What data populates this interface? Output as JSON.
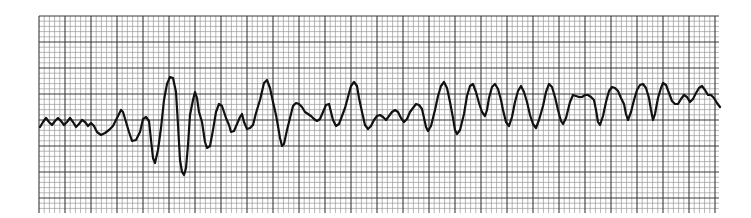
{
  "figure": {
    "kind": "ECG rhythm strip",
    "colors": {
      "background": "#ffffff",
      "paper_minor_grid": "#9a9a9a",
      "paper_major_grid": "#3a3a3a",
      "trace": "#111111"
    },
    "grid": {
      "left": 39,
      "top": 16,
      "right": 719,
      "bottom": 213,
      "minor_px": 5.2,
      "major_every": 5
    },
    "trace": {
      "stroke_width": 2.2,
      "points": [
        [
          40,
          127
        ],
        [
          43,
          122
        ],
        [
          46,
          118
        ],
        [
          49,
          122
        ],
        [
          52,
          125
        ],
        [
          55,
          121
        ],
        [
          58,
          118
        ],
        [
          61,
          121
        ],
        [
          64,
          125
        ],
        [
          67,
          122
        ],
        [
          70,
          118
        ],
        [
          73,
          122
        ],
        [
          76,
          127
        ],
        [
          79,
          124
        ],
        [
          82,
          120
        ],
        [
          85,
          122
        ],
        [
          88,
          126
        ],
        [
          91,
          123
        ],
        [
          94,
          126
        ],
        [
          97,
          132
        ],
        [
          101,
          135
        ],
        [
          105,
          133
        ],
        [
          109,
          130
        ],
        [
          113,
          126
        ],
        [
          117,
          118
        ],
        [
          121,
          110
        ],
        [
          123,
          112
        ],
        [
          126,
          122
        ],
        [
          129,
          132
        ],
        [
          132,
          141
        ],
        [
          136,
          140
        ],
        [
          140,
          132
        ],
        [
          143,
          119
        ],
        [
          146,
          117
        ],
        [
          149,
          121
        ],
        [
          151,
          140
        ],
        [
          153,
          158
        ],
        [
          155,
          163
        ],
        [
          158,
          150
        ],
        [
          161,
          128
        ],
        [
          164,
          100
        ],
        [
          167,
          84
        ],
        [
          170,
          77
        ],
        [
          173,
          78
        ],
        [
          176,
          92
        ],
        [
          178,
          125
        ],
        [
          180,
          160
        ],
        [
          182,
          172
        ],
        [
          184,
          175
        ],
        [
          186,
          168
        ],
        [
          188,
          145
        ],
        [
          190,
          115
        ],
        [
          193,
          100
        ],
        [
          195,
          92
        ],
        [
          197,
          98
        ],
        [
          199,
          112
        ],
        [
          202,
          122
        ],
        [
          205,
          142
        ],
        [
          207,
          148
        ],
        [
          210,
          146
        ],
        [
          213,
          130
        ],
        [
          216,
          112
        ],
        [
          219,
          104
        ],
        [
          222,
          106
        ],
        [
          224,
          112
        ],
        [
          226,
          118
        ],
        [
          229,
          125
        ],
        [
          231,
          132
        ],
        [
          234,
          131
        ],
        [
          237,
          124
        ],
        [
          240,
          117
        ],
        [
          242,
          114
        ],
        [
          244,
          122
        ],
        [
          247,
          129
        ],
        [
          250,
          128
        ],
        [
          253,
          125
        ],
        [
          256,
          113
        ],
        [
          260,
          100
        ],
        [
          264,
          83
        ],
        [
          267,
          80
        ],
        [
          270,
          88
        ],
        [
          273,
          102
        ],
        [
          276,
          115
        ],
        [
          278,
          126
        ],
        [
          280,
          138
        ],
        [
          282,
          146
        ],
        [
          284,
          144
        ],
        [
          287,
          130
        ],
        [
          290,
          118
        ],
        [
          293,
          106
        ],
        [
          296,
          103
        ],
        [
          299,
          104
        ],
        [
          302,
          107
        ],
        [
          305,
          112
        ],
        [
          308,
          114
        ],
        [
          311,
          116
        ],
        [
          314,
          119
        ],
        [
          317,
          121
        ],
        [
          320,
          119
        ],
        [
          323,
          112
        ],
        [
          326,
          105
        ],
        [
          329,
          104
        ],
        [
          331,
          112
        ],
        [
          333,
          120
        ],
        [
          336,
          126
        ],
        [
          339,
          124
        ],
        [
          342,
          116
        ],
        [
          345,
          108
        ],
        [
          348,
          97
        ],
        [
          351,
          86
        ],
        [
          354,
          82
        ],
        [
          357,
          86
        ],
        [
          359,
          98
        ],
        [
          362,
          112
        ],
        [
          365,
          125
        ],
        [
          368,
          129
        ],
        [
          371,
          126
        ],
        [
          374,
          120
        ],
        [
          377,
          116
        ],
        [
          380,
          115
        ],
        [
          383,
          117
        ],
        [
          386,
          120
        ],
        [
          389,
          116
        ],
        [
          392,
          112
        ],
        [
          395,
          110
        ],
        [
          398,
          112
        ],
        [
          401,
          118
        ],
        [
          404,
          122
        ],
        [
          407,
          119
        ],
        [
          410,
          112
        ],
        [
          413,
          108
        ],
        [
          416,
          104
        ],
        [
          419,
          105
        ],
        [
          422,
          109
        ],
        [
          424,
          118
        ],
        [
          426,
          127
        ],
        [
          428,
          131
        ],
        [
          431,
          126
        ],
        [
          435,
          110
        ],
        [
          438,
          96
        ],
        [
          441,
          86
        ],
        [
          444,
          82
        ],
        [
          447,
          88
        ],
        [
          450,
          102
        ],
        [
          453,
          118
        ],
        [
          455,
          130
        ],
        [
          457,
          134
        ],
        [
          460,
          130
        ],
        [
          464,
          114
        ],
        [
          467,
          96
        ],
        [
          470,
          86
        ],
        [
          473,
          84
        ],
        [
          476,
          92
        ],
        [
          479,
          103
        ],
        [
          482,
          112
        ],
        [
          485,
          116
        ],
        [
          487,
          110
        ],
        [
          489,
          98
        ],
        [
          492,
          87
        ],
        [
          495,
          84
        ],
        [
          498,
          89
        ],
        [
          501,
          100
        ],
        [
          503,
          110
        ],
        [
          506,
          122
        ],
        [
          509,
          126
        ],
        [
          512,
          117
        ],
        [
          515,
          102
        ],
        [
          518,
          91
        ],
        [
          521,
          86
        ],
        [
          524,
          92
        ],
        [
          527,
          102
        ],
        [
          530,
          115
        ],
        [
          533,
          124
        ],
        [
          536,
          128
        ],
        [
          539,
          120
        ],
        [
          543,
          106
        ],
        [
          546,
          92
        ],
        [
          549,
          84
        ],
        [
          552,
          87
        ],
        [
          555,
          97
        ],
        [
          558,
          110
        ],
        [
          561,
          121
        ],
        [
          563,
          124
        ],
        [
          566,
          118
        ],
        [
          570,
          102
        ],
        [
          573,
          95
        ],
        [
          576,
          96
        ],
        [
          579,
          97
        ],
        [
          582,
          97
        ],
        [
          585,
          95
        ],
        [
          588,
          95
        ],
        [
          591,
          97
        ],
        [
          594,
          100
        ],
        [
          596,
          110
        ],
        [
          598,
          122
        ],
        [
          600,
          125
        ],
        [
          603,
          116
        ],
        [
          606,
          102
        ],
        [
          609,
          91
        ],
        [
          612,
          87
        ],
        [
          615,
          88
        ],
        [
          618,
          91
        ],
        [
          621,
          98
        ],
        [
          624,
          104
        ],
        [
          626,
          114
        ],
        [
          628,
          120
        ],
        [
          631,
          112
        ],
        [
          634,
          100
        ],
        [
          637,
          90
        ],
        [
          640,
          85
        ],
        [
          643,
          84
        ],
        [
          646,
          88
        ],
        [
          649,
          98
        ],
        [
          651,
          110
        ],
        [
          653,
          120
        ],
        [
          655,
          114
        ],
        [
          658,
          98
        ],
        [
          661,
          88
        ],
        [
          663,
          83
        ],
        [
          666,
          85
        ],
        [
          669,
          93
        ],
        [
          672,
          101
        ],
        [
          675,
          104
        ],
        [
          678,
          104
        ],
        [
          681,
          99
        ],
        [
          684,
          95
        ],
        [
          687,
          97
        ],
        [
          690,
          102
        ],
        [
          693,
          99
        ],
        [
          696,
          93
        ],
        [
          699,
          88
        ],
        [
          702,
          86
        ],
        [
          705,
          90
        ],
        [
          708,
          95
        ],
        [
          711,
          95
        ],
        [
          714,
          98
        ],
        [
          717,
          103
        ],
        [
          720,
          107
        ],
        [
          723,
          104
        ],
        [
          726,
          100
        ],
        [
          729,
          97
        ],
        [
          732,
          99
        ],
        [
          735,
          102
        ],
        [
          738,
          105
        ],
        [
          741,
          106
        ],
        [
          744,
          104
        ],
        [
          747,
          101
        ],
        [
          750,
          100
        ]
      ]
    }
  }
}
